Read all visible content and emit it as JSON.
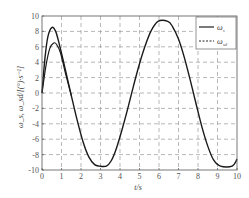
{
  "chart_data": {
    "type": "line",
    "title": "",
    "xlabel": "t/s",
    "ylabel": "ω_s, ω_sd/[(°)·s⁻¹]",
    "xlim": [
      0,
      10
    ],
    "ylim": [
      -10,
      10
    ],
    "xticks": [
      "0",
      "1",
      "2",
      "3",
      "4",
      "5",
      "6",
      "7",
      "8",
      "9",
      "10"
    ],
    "yticks": [
      "-10",
      "-8",
      "-6",
      "-4",
      "-2",
      "0",
      "2",
      "4",
      "6",
      "8",
      "10"
    ],
    "grid": true,
    "legend_position": "upper right",
    "series": [
      {
        "name": "ω_s",
        "style": "solid",
        "x": [
          0,
          0.15,
          0.3,
          0.5,
          0.7,
          0.9,
          1.2,
          1.5,
          1.8,
          2.1,
          2.4,
          2.7,
          2.95,
          3.3,
          3.55,
          3.8,
          4.1,
          4.4,
          4.7,
          5.0,
          5.3,
          5.6,
          5.95,
          6.45,
          6.7,
          7.0,
          7.3,
          7.6,
          7.9,
          8.2,
          8.5,
          8.8,
          9.15,
          9.75,
          10
        ],
        "y": [
          0,
          4.5,
          7.3,
          8.5,
          8.0,
          6.2,
          3.0,
          -0.3,
          -3.5,
          -6.3,
          -8.3,
          -9.3,
          -9.5,
          -9.5,
          -8.8,
          -7.3,
          -4.8,
          -2.0,
          1.0,
          3.8,
          6.2,
          8.1,
          9.3,
          9.3,
          8.6,
          7.0,
          4.6,
          1.7,
          -1.4,
          -4.4,
          -6.9,
          -8.7,
          -9.5,
          -9.5,
          -8.6
        ]
      },
      {
        "name": "ω_sd",
        "style": "dashed",
        "x": [
          0,
          0.2,
          0.4,
          0.6,
          0.75,
          0.95,
          1.2,
          1.5
        ],
        "y": [
          0,
          3.5,
          5.8,
          6.5,
          6.3,
          5.2,
          2.6,
          -0.3
        ]
      }
    ],
    "legend": [
      {
        "label": "ω_s",
        "style": "solid"
      },
      {
        "label": "ω_sd",
        "style": "dashed"
      }
    ]
  },
  "labels": {
    "xlabel": "t/s",
    "ylabel": "ω_s, ω_sd/[(°)·s⁻¹]",
    "legend_s": "ω",
    "legend_s_sub": "s",
    "legend_sd": "ω",
    "legend_sd_sub": "sd"
  }
}
